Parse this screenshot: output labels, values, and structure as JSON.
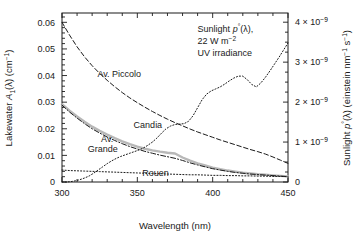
{
  "chart_data": {
    "type": "line",
    "title": "",
    "xlabel": "Wavelength (nm)",
    "ylabel_left": "Lakewater A1(λ) (cm−1)",
    "ylabel_right": "Sunlight p°(λ) (einstein nm−1 s−1)",
    "xlim": [
      300,
      450
    ],
    "ylim_left": [
      0,
      0.0635
    ],
    "ylim_right": [
      0,
      4.23e-09
    ],
    "grid": false,
    "legend": "inline-curve-labels",
    "xticks": [
      300,
      350,
      400,
      450
    ],
    "xtick_labels": [
      "300",
      "350",
      "400",
      "450"
    ],
    "xminor_step": 10,
    "yticks_left": [
      0,
      0.01,
      0.02,
      0.03,
      0.04,
      0.05,
      0.06
    ],
    "ytick_labels_left": [
      "0",
      "0.01",
      "0.02",
      "0.03",
      "0.04",
      "0.05",
      "0.06"
    ],
    "yminor_step_left": 0.002,
    "yticks_right": [
      0,
      1e-09,
      2e-09,
      3e-09,
      4e-09
    ],
    "ytick_labels_right": [
      "0",
      "1 × 10−9",
      "2 × 10−9",
      "3 × 10−9",
      "4 × 10−9"
    ],
    "yminor_step_right": 2.5e-10,
    "series": [
      {
        "name": "Av. Piccolo",
        "axis": "left",
        "style": "dashed",
        "color": "#1a1a1a",
        "label_x": 338,
        "label_y": 0.0395,
        "x": [
          300,
          305,
          310,
          315,
          320,
          325,
          330,
          335,
          340,
          345,
          350,
          355,
          360,
          365,
          370,
          375,
          380,
          385,
          390,
          395,
          400,
          405,
          410,
          415,
          420,
          425,
          430,
          435,
          440,
          445,
          450
        ],
        "y": [
          0.06,
          0.0552,
          0.0508,
          0.047,
          0.0437,
          0.0408,
          0.0382,
          0.0358,
          0.0336,
          0.0316,
          0.0298,
          0.0281,
          0.0265,
          0.025,
          0.0236,
          0.0223,
          0.0211,
          0.0199,
          0.0188,
          0.0178,
          0.0168,
          0.0158,
          0.0149,
          0.014,
          0.0131,
          0.0122,
          0.0114,
          0.0105,
          0.0094,
          0.0082,
          0.007
        ]
      },
      {
        "name": "Candia",
        "axis": "left",
        "style": "solid-gray",
        "color": "#b8b8b8",
        "label_x": 357,
        "label_y": 0.02,
        "x": [
          300,
          305,
          310,
          315,
          320,
          325,
          330,
          335,
          340,
          345,
          350,
          355,
          360,
          365,
          370,
          375,
          380,
          385,
          390,
          395,
          400,
          405,
          410,
          415,
          420,
          425,
          430,
          435,
          440,
          445,
          450
        ],
        "y": [
          0.0292,
          0.0268,
          0.0246,
          0.0226,
          0.0208,
          0.0192,
          0.0178,
          0.0165,
          0.0153,
          0.0142,
          0.0133,
          0.0125,
          0.0119,
          0.0114,
          0.011,
          0.0107,
          0.0092,
          0.008,
          0.007,
          0.0062,
          0.0054,
          0.0048,
          0.0043,
          0.0039,
          0.0035,
          0.0032,
          0.0029,
          0.0027,
          0.0025,
          0.0023,
          0.0021
        ]
      },
      {
        "name": "Av. Grande",
        "axis": "left",
        "style": "dashdot",
        "color": "#1a1a1a",
        "label_x": 328,
        "label_y": 0.0148,
        "x": [
          300,
          305,
          310,
          315,
          320,
          325,
          330,
          335,
          340,
          345,
          350,
          355,
          360,
          365,
          370,
          375,
          380,
          385,
          390,
          395,
          400,
          405,
          410,
          415,
          420,
          425,
          430,
          435,
          440,
          445,
          450
        ],
        "y": [
          0.0289,
          0.0263,
          0.024,
          0.0219,
          0.02,
          0.0184,
          0.0169,
          0.0156,
          0.0144,
          0.0133,
          0.0124,
          0.0115,
          0.0108,
          0.0101,
          0.0095,
          0.0089,
          0.0081,
          0.0072,
          0.0064,
          0.0057,
          0.005,
          0.0045,
          0.004,
          0.0036,
          0.0033,
          0.003,
          0.0028,
          0.0026,
          0.0024,
          0.0022,
          0.002
        ]
      },
      {
        "name": "Rouen",
        "axis": "left",
        "style": "dotted",
        "color": "#1a1a1a",
        "label_x": 362,
        "label_y": 0.0022,
        "x": [
          300,
          305,
          310,
          315,
          320,
          325,
          330,
          335,
          340,
          345,
          350,
          355,
          360,
          365,
          370,
          375,
          380,
          385,
          390,
          395,
          400,
          405,
          410,
          415,
          420,
          425,
          430,
          435,
          440,
          445,
          450
        ],
        "y": [
          0.0045,
          0.0043,
          0.0042,
          0.0041,
          0.004,
          0.0039,
          0.0038,
          0.0037,
          0.0036,
          0.0035,
          0.0034,
          0.0033,
          0.0032,
          0.0031,
          0.003,
          0.0029,
          0.0028,
          0.0027,
          0.0027,
          0.0026,
          0.0025,
          0.0025,
          0.0024,
          0.0024,
          0.0023,
          0.0023,
          0.0022,
          0.0022,
          0.0021,
          0.0021,
          0.002
        ]
      },
      {
        "name": "Sunlight p0",
        "axis": "right",
        "style": "dotted",
        "color": "#1a1a1a",
        "label_x": 400,
        "label_y": 3.7e-09,
        "x": [
          300,
          303,
          306,
          309,
          312,
          315,
          318,
          321,
          324,
          327,
          330,
          333,
          336,
          339,
          342,
          345,
          348,
          351,
          354,
          357,
          360,
          363,
          366,
          369,
          372,
          375,
          378,
          381,
          384,
          387,
          390,
          393,
          396,
          399,
          402,
          405,
          408,
          411,
          414,
          417,
          420,
          423,
          426,
          429,
          432,
          435,
          438,
          441,
          444,
          447,
          450
        ],
        "y": [
          0.0,
          0.0,
          1e-11,
          3e-11,
          6e-11,
          1e-10,
          1.5e-10,
          2.2e-10,
          3e-10,
          3.8e-10,
          4.6e-10,
          5.3e-10,
          5.9e-10,
          6.4e-10,
          6.8e-10,
          7.2e-10,
          7.6e-10,
          8e-10,
          8.5e-10,
          9.2e-10,
          1e-09,
          1.1e-09,
          1.22e-09,
          1.33e-09,
          1.4e-09,
          1.44e-09,
          1.45e-09,
          1.46e-09,
          1.52e-09,
          1.66e-09,
          1.86e-09,
          2.06e-09,
          2.2e-09,
          2.28e-09,
          2.33e-09,
          2.38e-09,
          2.45e-09,
          2.53e-09,
          2.6e-09,
          2.65e-09,
          2.65e-09,
          2.56e-09,
          2.44e-09,
          2.38e-09,
          2.48e-09,
          2.62e-09,
          2.78e-09,
          2.95e-09,
          3.12e-09,
          3.3e-09,
          3.48e-09
        ]
      }
    ],
    "annotations": [
      {
        "name": "sunlight-annotation",
        "line1": "Sunlight p°(λ),",
        "line2": "22 W m−2",
        "line3": "UV irradiance"
      }
    ]
  },
  "labels": {
    "xaxis_title": "Wavelength (nm)",
    "yaxis_left_pre": "Lakewater ",
    "yaxis_left_var": "A",
    "yaxis_left_sub": "1",
    "yaxis_left_post": "(λ) (cm",
    "yaxis_left_sup": "−1",
    "yaxis_left_end": ")",
    "yaxis_right_pre": "Sunlight ",
    "yaxis_right_var": "p",
    "yaxis_right_sup1": "°",
    "yaxis_right_mid": "(λ) (einstein nm",
    "yaxis_right_sup2": "−1",
    "yaxis_right_mid2": " s",
    "yaxis_right_sup3": "−1",
    "yaxis_right_end": ")",
    "curve_piccolo": "Av. Piccolo",
    "curve_candia": "Candia",
    "curve_grande_line1": "Av.",
    "curve_grande_line2": "Grande",
    "curve_rouen": "Rouen",
    "annot_line1_pre": "Sunlight ",
    "annot_line1_var": "p",
    "annot_line1_sup": "°",
    "annot_line1_post": "(λ),",
    "annot_line2_pre": "22 W m",
    "annot_line2_sup": "−2",
    "annot_line3": "UV irradiance"
  }
}
